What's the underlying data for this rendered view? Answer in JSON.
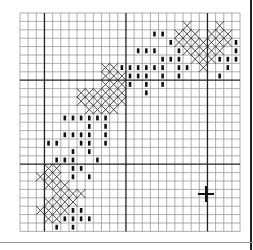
{
  "grid": {
    "cols": 27,
    "rows": 26,
    "cell_w": 8.15,
    "cell_h": 8.4,
    "major_every": 10,
    "major_cols": [
      3,
      13,
      23
    ],
    "major_rows": [
      8,
      18
    ],
    "line_color": "#9a9a9a",
    "major_color": "#222222"
  },
  "legend": {
    "cross": "full cross stitch (X)",
    "bar": "straight stitch (dash)"
  },
  "stitches": [
    {
      "row": 1,
      "x": [
        20,
        24
      ],
      "bar": []
    },
    {
      "row": 2,
      "x": [
        19,
        20,
        21,
        23,
        24,
        25
      ],
      "bar": [
        16,
        17
      ]
    },
    {
      "row": 3,
      "x": [
        19,
        20,
        21,
        22,
        23,
        24,
        25
      ],
      "bar": [
        18,
        26
      ]
    },
    {
      "row": 4,
      "x": [
        20,
        21,
        22,
        23,
        24
      ],
      "bar": [
        14,
        15,
        16,
        19,
        26
      ]
    },
    {
      "row": 5,
      "x": [
        21,
        22,
        23
      ],
      "bar": [
        17,
        18,
        19,
        24,
        25,
        26
      ]
    },
    {
      "row": 6,
      "x": [
        10,
        11,
        22
      ],
      "bar": [
        12,
        13,
        14,
        15,
        16,
        17,
        19,
        20,
        25
      ]
    },
    {
      "row": 7,
      "x": [
        10,
        11,
        12
      ],
      "bar": [
        13,
        14,
        15,
        17,
        19,
        24
      ]
    },
    {
      "row": 8,
      "x": [
        10,
        11,
        12
      ],
      "bar": [
        13,
        15,
        17
      ]
    },
    {
      "row": 9,
      "x": [
        7,
        8,
        9,
        10,
        11,
        12
      ],
      "bar": [
        15
      ]
    },
    {
      "row": 10,
      "x": [
        7,
        8,
        9,
        10,
        11,
        12
      ],
      "bar": []
    },
    {
      "row": 11,
      "x": [
        8,
        9,
        10,
        11
      ],
      "bar": []
    },
    {
      "row": 12,
      "x": [],
      "bar": [
        5,
        6,
        7,
        8,
        9,
        10
      ]
    },
    {
      "row": 13,
      "x": [],
      "bar": [
        8,
        10
      ]
    },
    {
      "row": 14,
      "x": [],
      "bar": [
        5,
        6,
        7,
        8,
        10
      ]
    },
    {
      "row": 15,
      "x": [],
      "bar": [
        3,
        4,
        7,
        8,
        10
      ]
    },
    {
      "row": 16,
      "x": [],
      "bar": [
        6,
        8
      ]
    },
    {
      "row": 17,
      "x": [],
      "bar": [
        4,
        5,
        6,
        9
      ]
    },
    {
      "row": 18,
      "x": [
        3,
        4
      ],
      "bar": [
        6,
        7
      ]
    },
    {
      "row": 19,
      "x": [
        2,
        3,
        4
      ],
      "bar": [
        6,
        8
      ]
    },
    {
      "row": 20,
      "x": [
        3,
        4,
        5
      ],
      "bar": []
    },
    {
      "row": 21,
      "x": [
        4,
        5,
        6,
        7
      ],
      "bar": []
    },
    {
      "row": 22,
      "x": [
        3,
        4,
        5,
        6
      ],
      "bar": []
    },
    {
      "row": 23,
      "x": [
        2,
        3,
        4,
        5
      ],
      "bar": [
        6,
        7
      ]
    },
    {
      "row": 24,
      "x": [
        3,
        4
      ],
      "bar": [
        5,
        6,
        7,
        8
      ]
    },
    {
      "row": 25,
      "x": [],
      "bar": [
        4,
        6
      ]
    }
  ],
  "center_marker": {
    "label": "center-cross",
    "x": 186,
    "y": 181,
    "arm": 8
  }
}
